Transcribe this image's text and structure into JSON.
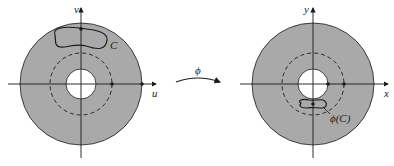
{
  "left_panel": {
    "axis_x_label": "u",
    "axis_y_label": "v",
    "curve_label": "C"
  },
  "right_panel": {
    "axis_x_label": "x",
    "axis_y_label": "y",
    "curve_label": "ϕ(C)"
  },
  "mapping_label": "ϕ",
  "colors": {
    "disk_fill": "#a9a9a9",
    "stroke": "#1a1a1a",
    "background": "#ffffff"
  }
}
